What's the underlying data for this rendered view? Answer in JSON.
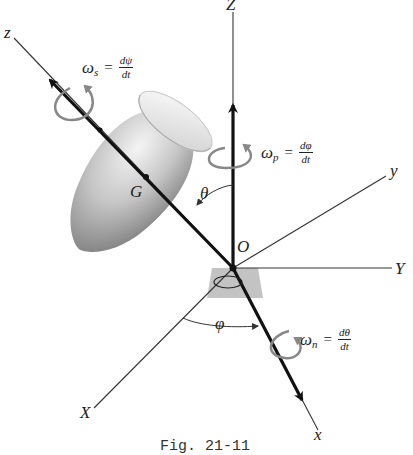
{
  "figure": {
    "caption": "Fig. 21-11",
    "axes": {
      "Z": "Z",
      "Y": "Y",
      "X": "X",
      "z": "z",
      "y": "y",
      "x": "x"
    },
    "points": {
      "origin": "O",
      "center_of_mass": "G"
    },
    "angles": {
      "theta": "θ",
      "phi": "φ"
    },
    "angular_velocities": {
      "spin": {
        "symbol": "ω",
        "subscript": "s",
        "equals": "=",
        "numerator": "dψ",
        "denominator": "dt"
      },
      "precession": {
        "symbol": "ω",
        "subscript": "p",
        "equals": "=",
        "numerator": "dφ",
        "denominator": "dt"
      },
      "nutation": {
        "symbol": "ω",
        "subscript": "n",
        "equals": "=",
        "numerator": "dθ",
        "denominator": "dt"
      }
    },
    "colors": {
      "axis_line": "#333333",
      "vector_arrow": "#111111",
      "rotation_arrow": "#808080",
      "body_light": "#f2f2f2",
      "body_dark": "#7a7a7a",
      "base_plate": "#b8b8b8"
    }
  }
}
